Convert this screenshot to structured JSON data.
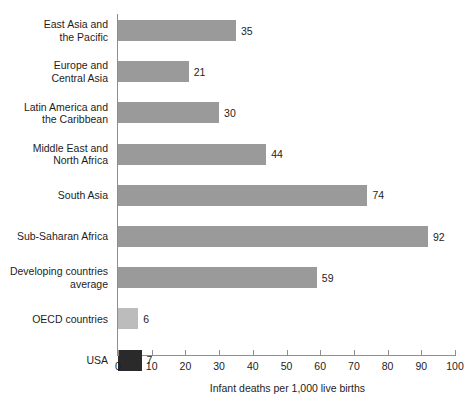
{
  "chart_data": {
    "type": "bar",
    "orientation": "horizontal",
    "title": "",
    "xlabel": "Infant deaths per 1,000 live births",
    "ylabel": "",
    "xlim": [
      0,
      100
    ],
    "xticks": [
      0,
      10,
      20,
      30,
      40,
      50,
      60,
      70,
      80,
      90,
      100
    ],
    "grid": false,
    "legend": false,
    "categories": [
      "East Asia and\nthe Pacific",
      "Europe and\nCentral Asia",
      "Latin America and\nthe Caribbean",
      "Middle East and\nNorth Africa",
      "South Asia",
      "Sub-Saharan Africa",
      "Developing countries\naverage",
      "OECD countries",
      "USA"
    ],
    "values": [
      35,
      21,
      30,
      44,
      74,
      92,
      59,
      6,
      7
    ],
    "value_labels": [
      "35",
      "21",
      "30",
      "44",
      "74",
      "92",
      "59",
      "6",
      "7"
    ],
    "bar_colors": [
      "#9a9a9a",
      "#9a9a9a",
      "#9a9a9a",
      "#9a9a9a",
      "#9a9a9a",
      "#9a9a9a",
      "#9a9a9a",
      "#bcbcbc",
      "#2a2a2a"
    ],
    "bar_styles": [
      "mid",
      "mid",
      "mid",
      "mid",
      "mid",
      "mid",
      "mid",
      "light",
      "dark"
    ],
    "axis_color": "#8e8e8e",
    "text_color": "#1d1d1d",
    "background": "#ffffff"
  },
  "xtick_labels": [
    "0",
    "10",
    "20",
    "30",
    "40",
    "50",
    "60",
    "70",
    "80",
    "90",
    "100"
  ]
}
